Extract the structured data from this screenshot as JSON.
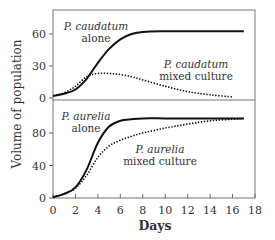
{
  "chart_data": [
    {
      "type": "line",
      "panel": "top",
      "title": "",
      "xlabel": "Days",
      "ylabel": "Volume of population",
      "xlim": [
        0,
        18
      ],
      "ylim": [
        0,
        75
      ],
      "yticks": [
        0,
        30,
        60
      ],
      "grid": false,
      "series": [
        {
          "name": "P. caudatum alone",
          "style": "solid",
          "x": [
            0,
            1,
            2,
            3,
            4,
            5,
            6,
            7,
            8,
            10,
            12,
            14,
            16,
            17
          ],
          "values": [
            2,
            4,
            8,
            18,
            33,
            46,
            55,
            60,
            62,
            62.5,
            62.5,
            62.5,
            62.5,
            62.5
          ]
        },
        {
          "name": "P. caudatum mixed culture",
          "style": "dotted",
          "x": [
            0,
            1,
            2,
            3,
            4,
            5,
            6,
            7,
            8,
            10,
            12,
            14,
            16
          ],
          "values": [
            2,
            5,
            11,
            20,
            23,
            23,
            22,
            20,
            17,
            11,
            6,
            3,
            1
          ]
        }
      ],
      "annotations": [
        {
          "text": "P. caudatum\nalone",
          "target": "P. caudatum alone"
        },
        {
          "text": "P. caudatum\nmixed culture",
          "target": "P. caudatum mixed culture"
        }
      ]
    },
    {
      "type": "line",
      "panel": "bottom",
      "title": "",
      "xlabel": "Days",
      "ylabel": "Volume of population",
      "xlim": [
        0,
        18
      ],
      "ylim": [
        0,
        120
      ],
      "xticks": [
        0,
        2,
        4,
        6,
        8,
        10,
        12,
        14,
        16,
        18
      ],
      "yticks": [
        0,
        40,
        80
      ],
      "grid": false,
      "series": [
        {
          "name": "P. aurelia alone",
          "style": "solid",
          "x": [
            0,
            1,
            2,
            3,
            4,
            5,
            6,
            7,
            8,
            10,
            12,
            14,
            16,
            17
          ],
          "values": [
            1,
            5,
            13,
            35,
            68,
            88,
            95,
            97,
            98,
            98,
            98,
            98,
            98,
            98
          ]
        },
        {
          "name": "P. aurelia mixed culture",
          "style": "dotted",
          "x": [
            0,
            1,
            2,
            3,
            4,
            5,
            6,
            7,
            8,
            10,
            12,
            14,
            16,
            17
          ],
          "values": [
            1,
            5,
            12,
            28,
            50,
            64,
            71,
            76,
            80,
            86,
            91,
            95,
            97,
            98
          ]
        }
      ],
      "annotations": [
        {
          "text": "P. aurelia\nalone",
          "target": "P. aurelia alone"
        },
        {
          "text": "P. aurelia\nmixed culture",
          "target": "P. aurelia mixed culture"
        }
      ]
    }
  ],
  "labels": {
    "ylabel": "Volume of population",
    "xlabel": "Days",
    "top_solid_line1": "P. caudatum",
    "top_solid_line2": "alone",
    "top_dotted_line1": "P. caudatum",
    "top_dotted_line2": "mixed culture",
    "bottom_solid_line1": "P. aurelia",
    "bottom_solid_line2": "alone",
    "bottom_dotted_line1": "P. aurelia",
    "bottom_dotted_line2": "mixed culture"
  },
  "colors": {
    "line": "#111111",
    "axis": "#555555",
    "text": "#333333"
  }
}
